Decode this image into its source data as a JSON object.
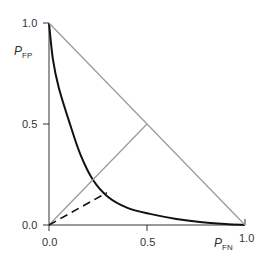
{
  "chart_data": {
    "type": "line",
    "title": "",
    "xlabel": "P_FN",
    "ylabel": "P_FP",
    "xlabel_main": "P",
    "xlabel_sub": "FN",
    "ylabel_main": "P",
    "ylabel_sub": "FP",
    "xlim": [
      0.0,
      1.0
    ],
    "ylim": [
      0.0,
      1.0
    ],
    "x_ticks": [
      "0.0",
      "0.5",
      "1.0"
    ],
    "y_ticks": [
      "0.0",
      "0.5",
      "1.0"
    ],
    "grid": false,
    "legend": null,
    "series": [
      {
        "name": "operating-characteristic-curve",
        "style": "solid",
        "color": "#111111",
        "x": [
          0.0,
          0.02,
          0.05,
          0.107,
          0.16,
          0.224,
          0.3,
          0.4,
          0.515,
          0.65,
          0.77,
          0.9,
          1.0
        ],
        "y": [
          1.0,
          0.82,
          0.68,
          0.5,
          0.35,
          0.224,
          0.14,
          0.085,
          0.055,
          0.03,
          0.015,
          0.005,
          0.0
        ]
      },
      {
        "name": "equal-error-diagonal",
        "style": "solid",
        "color": "#999999",
        "x": [
          0.0,
          0.5
        ],
        "y": [
          0.0,
          0.5
        ]
      },
      {
        "name": "anti-diagonal",
        "style": "solid",
        "color": "#999999",
        "x": [
          0.0,
          1.0
        ],
        "y": [
          1.0,
          0.0
        ]
      },
      {
        "name": "dashed-line",
        "style": "dashed",
        "color": "#111111",
        "x": [
          0.0,
          0.295
        ],
        "y": [
          0.0,
          0.16
        ]
      }
    ]
  }
}
